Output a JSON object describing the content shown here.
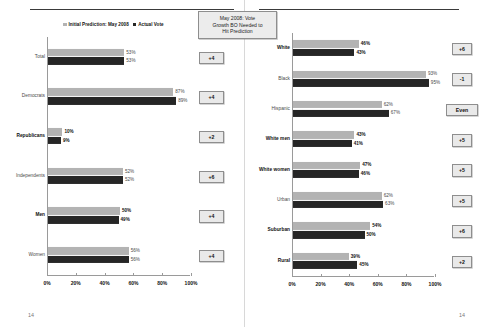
{
  "legend": {
    "prediction_label": "Initial Prediction: May 2008",
    "actual_label": "Actual Vote"
  },
  "callout": {
    "line1": "May 2008: Vote",
    "line2": "Growth BO Needed to",
    "line3": "Hit Prediction"
  },
  "axis": {
    "ticks": [
      "0%",
      "20%",
      "40%",
      "60%",
      "80%",
      "100%"
    ],
    "min": 0,
    "max": 100
  },
  "page": {
    "left_number": "14",
    "right_number": "14"
  },
  "colors": {
    "prediction": "#b3b3b3",
    "actual": "#262626",
    "badge_bg": "#e9e9e9",
    "badge_border": "#8e8e8e"
  },
  "chart_data": [
    {
      "type": "bar",
      "orientation": "horizontal",
      "title": "",
      "xlabel": "",
      "ylabel": "",
      "xlim": [
        0,
        100
      ],
      "grid": false,
      "legend_position": "top",
      "categories": [
        "Total",
        "Democrats",
        "Republicans",
        "Independents",
        "Men",
        "Women"
      ],
      "series": [
        {
          "name": "Initial Prediction: May 2008",
          "values": [
            53,
            87,
            10,
            52,
            50,
            56
          ]
        },
        {
          "name": "Actual Vote",
          "values": [
            53,
            89,
            9,
            52,
            49,
            56
          ]
        }
      ],
      "value_labels": [
        {
          "pred": "53%",
          "actual": "53%"
        },
        {
          "pred": "87%",
          "actual": "89%"
        },
        {
          "pred": "10%",
          "actual": "9%"
        },
        {
          "pred": "52%",
          "actual": "52%"
        },
        {
          "pred": "50%",
          "actual": "49%"
        },
        {
          "pred": "56%",
          "actual": "56%"
        }
      ],
      "annotations": [
        "+4",
        "+4",
        "+2",
        "+6",
        "+4",
        "+4"
      ],
      "bold_rows": [
        false,
        false,
        true,
        false,
        true,
        false
      ]
    },
    {
      "type": "bar",
      "orientation": "horizontal",
      "title": "",
      "xlabel": "",
      "ylabel": "",
      "xlim": [
        0,
        100
      ],
      "grid": false,
      "legend_position": "top",
      "categories": [
        "White",
        "Black",
        "Hispanic",
        "White men",
        "White women",
        "Urban",
        "Suburban",
        "Rural"
      ],
      "series": [
        {
          "name": "Initial Prediction: May 2008",
          "values": [
            46,
            93,
            62,
            43,
            47,
            62,
            54,
            39
          ]
        },
        {
          "name": "Actual Vote",
          "values": [
            43,
            95,
            67,
            41,
            46,
            63,
            50,
            45
          ]
        }
      ],
      "value_labels": [
        {
          "pred": "46%",
          "actual": "43%"
        },
        {
          "pred": "93%",
          "actual": "95%"
        },
        {
          "pred": "62%",
          "actual": "67%"
        },
        {
          "pred": "43%",
          "actual": "41%"
        },
        {
          "pred": "47%",
          "actual": "46%"
        },
        {
          "pred": "62%",
          "actual": "63%"
        },
        {
          "pred": "54%",
          "actual": "50%"
        },
        {
          "pred": "39%",
          "actual": "45%"
        }
      ],
      "annotations": [
        "+6",
        "-1",
        "Even",
        "+5",
        "+5",
        "+5",
        "+6",
        "+2"
      ],
      "bold_rows": [
        true,
        false,
        false,
        true,
        true,
        false,
        true,
        true
      ]
    }
  ]
}
